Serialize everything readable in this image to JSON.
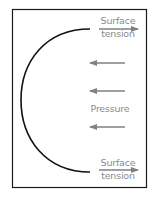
{
  "diagram": {
    "labels": {
      "top_surface_tension_line1": "Surface",
      "top_surface_tension_line2": "tension",
      "pressure": "Pressure",
      "bottom_surface_tension_line1": "Surface",
      "bottom_surface_tension_line2": "tension"
    },
    "colors": {
      "frame": "#1a1a1a",
      "curve": "#111111",
      "arrow": "#808080",
      "text": "#8a8a8a"
    },
    "arrows": {
      "surface_tension_direction": "right",
      "pressure_direction": "left",
      "pressure_arrow_count": 3
    }
  }
}
